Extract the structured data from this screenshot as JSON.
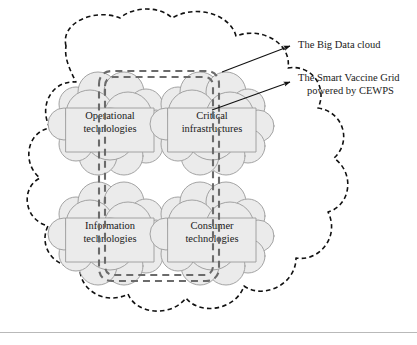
{
  "figure": {
    "title": "The Big Data cloud containing the Smart Vaccine Grid",
    "background_color": "#ffffff"
  },
  "colors": {
    "inner_cloud_fill": "#ebebeb",
    "inner_cloud_stroke": "#9a9a9a",
    "outer_cloud_stroke": "#111111",
    "grid_stroke": "#6b6b6b",
    "text": "#1a1a1a",
    "leader_stroke": "#111111",
    "footer_rule": "#b9b9b9"
  },
  "clouds": [
    {
      "id": "operational-technologies",
      "line1": "Operational",
      "line2": "technologies",
      "cx": 110,
      "cy": 122
    },
    {
      "id": "critical-infrastructures",
      "line1": "Critical",
      "line2": "infrastructures",
      "cx": 212,
      "cy": 122
    },
    {
      "id": "information-technologies",
      "line1": "Information",
      "line2": "technologies",
      "cx": 110,
      "cy": 232
    },
    {
      "id": "consumer-technologies",
      "line1": "Consumer",
      "line2": "technologies",
      "cx": 212,
      "cy": 232
    }
  ],
  "callouts": [
    {
      "id": "big-data-cloud",
      "lines": [
        "The Big Data cloud"
      ],
      "text_x": 298,
      "text_y": 46,
      "arrow_from": [
        222,
        72
      ],
      "arrow_to": [
        290,
        46
      ]
    },
    {
      "id": "smart-vaccine-grid",
      "lines": [
        "The Smart Vaccine Grid",
        "powered by CEWPS"
      ],
      "text_x": 298,
      "text_y": 82,
      "arrow_from": [
        212,
        110
      ],
      "arrow_to": [
        290,
        88
      ]
    }
  ],
  "grid": {
    "label": "Smart Vaccine Grid ring",
    "style": "double dashed rail loop",
    "description": "A closed rounded-rectangle rail connecting the four technology clouds"
  },
  "outer_cloud": {
    "label": "Big Data cloud",
    "style": "dashed scalloped outline"
  }
}
